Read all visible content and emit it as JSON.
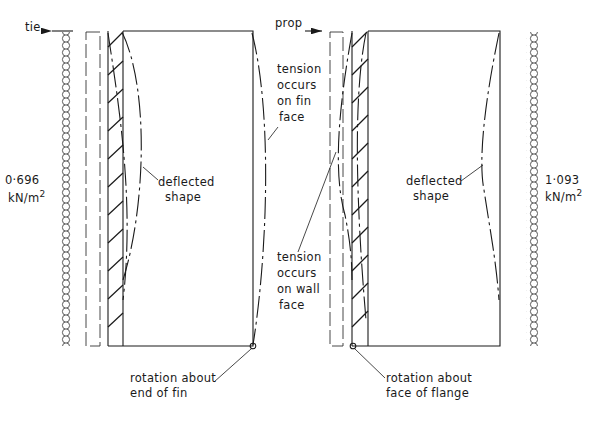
{
  "left_panel": {
    "support_label": "tie",
    "load_value": "0·696",
    "load_unit": "kN/m",
    "load_unit_exp": "2",
    "deflection_label_1": "deflected",
    "deflection_label_2": "shape",
    "tension_label": [
      "tension",
      "occurs",
      "on fin",
      "face"
    ],
    "rotation_label_1": "rotation about",
    "rotation_label_2": "end of fin"
  },
  "right_panel": {
    "support_label": "prop",
    "load_value": "1·093",
    "load_unit": "kN/m",
    "load_unit_exp": "2",
    "deflection_label_1": "deflected",
    "deflection_label_2": "shape",
    "tension_label": [
      "tension",
      "occurs",
      "on wall",
      "face"
    ],
    "rotation_label_1": "rotation about",
    "rotation_label_2": "face of flange"
  },
  "colors": {
    "line": "#1a1a1a",
    "background": "#ffffff"
  }
}
